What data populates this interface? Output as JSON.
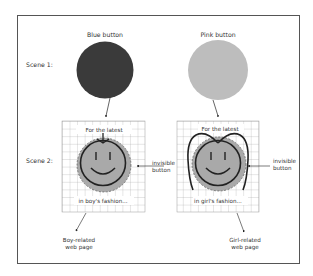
{
  "diagram": {
    "scene_labels": [
      "Scene 1:",
      "Scene 2:"
    ],
    "scene1": {
      "left_button": {
        "label": "Blue button",
        "color": "#3a3a3a"
      },
      "right_button": {
        "label": "Pink button",
        "color": "#bdbdbd"
      }
    },
    "scene2": {
      "left_page": {
        "top_text": "For the latest",
        "bottom_text": "in boy's fashion...",
        "side_label_line1": "invisible",
        "side_label_line2": "button",
        "result_line1": "Boy-related",
        "result_line2": "web page"
      },
      "right_page": {
        "top_text": "For the latest",
        "bottom_text": "in girl's fashion...",
        "side_label_line1": "invisible",
        "side_label_line2": "button",
        "result_line1": "Girl-related",
        "result_line2": "web page"
      }
    },
    "colors": {
      "face_fill": "#a9a9a9",
      "line": "#222222",
      "grid": "#9a9a9a"
    }
  }
}
